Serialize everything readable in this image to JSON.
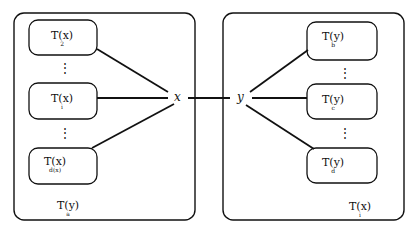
{
  "diagram": {
    "left_group": {
      "label": {
        "main": "T(y)",
        "sub": "a"
      },
      "boxes": [
        {
          "main": "T(x)",
          "sub": "2"
        },
        {
          "main": "T(x)",
          "sub": "i"
        },
        {
          "main": "T(x)",
          "sub": "d(x)"
        }
      ],
      "ellipsis": [
        "⋮",
        "⋮"
      ]
    },
    "right_group": {
      "label": {
        "main": "T(x)",
        "sub": "i"
      },
      "boxes": [
        {
          "main": "T(y)",
          "sub": "b"
        },
        {
          "main": "T(y)",
          "sub": "c"
        },
        {
          "main": "T(y)",
          "sub": "d"
        }
      ],
      "ellipsis": [
        "⋮",
        "⋮"
      ]
    },
    "center": {
      "x_node": "x",
      "y_node": "y"
    },
    "colors": {
      "stroke": "#111111",
      "background": "#ffffff"
    }
  }
}
